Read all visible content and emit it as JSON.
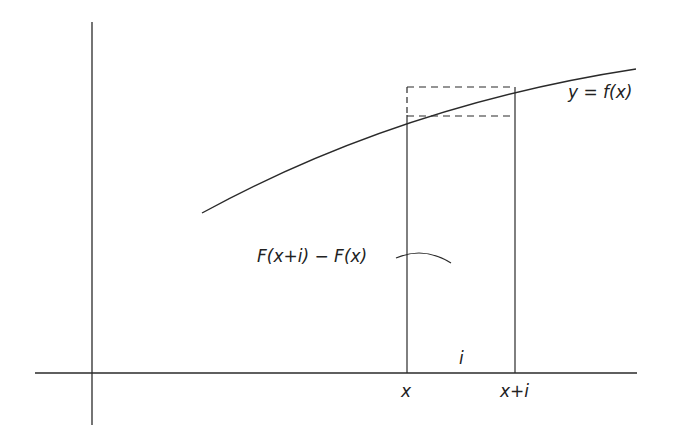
{
  "diagram": {
    "colors": {
      "stroke": "#2a2a2a",
      "background": "#ffffff"
    },
    "axes": {
      "y_axis": {
        "x": 92,
        "y1": 22,
        "y2": 425
      },
      "x_axis": {
        "y": 373,
        "x1": 35,
        "x2": 637
      }
    },
    "curve": {
      "path": "M 202 213 Q 400 105 636 69"
    },
    "verticals": {
      "left": {
        "x": 407,
        "y_solid_top": 115,
        "y_dashed_top": 87,
        "y_bottom": 373
      },
      "right": {
        "x": 515,
        "y_top": 87,
        "y_bottom": 373
      }
    },
    "dashed_horizontals": [
      {
        "y": 87,
        "x1": 407,
        "x2": 515
      },
      {
        "y": 116,
        "x1": 407,
        "x2": 515
      }
    ],
    "pointer_arc": {
      "path": "M 396 258 Q 424 246 451 263"
    },
    "labels": {
      "curve": "y = f(x)",
      "area": "F(x+i) − F(x)",
      "width": "i",
      "x": "x",
      "x_plus_i": "x+i"
    }
  }
}
